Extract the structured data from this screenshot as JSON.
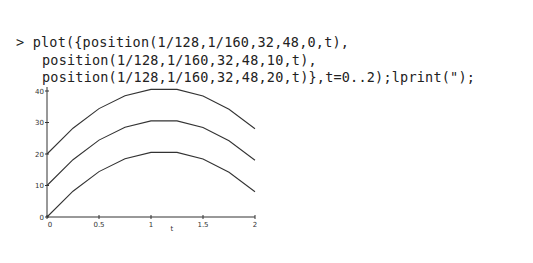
{
  "worksheet": {
    "prompt": ">",
    "input_lines": [
      "plot({position(1/128,1/160,32,48,0,t),",
      "position(1/128,1/160,32,48,10,t),",
      "position(1/128,1/160,32,48,20,t)},t=0..2);lprint(\");"
    ]
  },
  "chart_data": {
    "type": "line",
    "title": "",
    "xlabel": "t",
    "ylabel": "",
    "xlim": [
      0,
      2
    ],
    "ylim": [
      0,
      40
    ],
    "x_ticks": [
      "0",
      "0.5",
      "1",
      "1.5",
      "2"
    ],
    "y_ticks": [
      "0",
      "10",
      "20",
      "30",
      "40"
    ],
    "grid": false,
    "legend": null,
    "x": [
      0,
      0.25,
      0.5,
      0.75,
      1.0,
      1.25,
      1.5,
      1.75,
      2.0
    ],
    "series": [
      {
        "name": "position(1/128,1/160,32,48,0,t)",
        "values": [
          0,
          8.2,
          14.4,
          18.5,
          20.5,
          20.5,
          18.4,
          14.2,
          8
        ]
      },
      {
        "name": "position(1/128,1/160,32,48,10,t)",
        "values": [
          10,
          18.2,
          24.4,
          28.5,
          30.5,
          30.5,
          28.4,
          24.2,
          18
        ]
      },
      {
        "name": "position(1/128,1/160,32,48,20,t)",
        "values": [
          20,
          28.2,
          34.4,
          38.5,
          40.5,
          40.5,
          38.4,
          34.2,
          28
        ]
      }
    ]
  }
}
